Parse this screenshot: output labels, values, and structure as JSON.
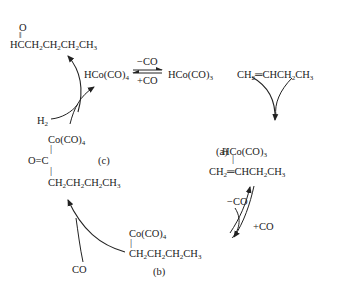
{
  "diagram": {
    "type": "catalytic cycle",
    "species": {
      "product_aldehyde": {
        "carbonyl_o": "O",
        "formula": "HCCH2CH2CH2CH3"
      },
      "catalyst_precursor": "HCo(CO)4",
      "active_catalyst": "HCo(CO)3",
      "alkene": "CH2=CHCH2CH3",
      "complex_a": {
        "label": "(a)",
        "top": "HCo(CO)3",
        "bottom": "CH2=CHCH2CH3"
      },
      "complex_b": {
        "label": "(b)",
        "top": "Co(CO)4",
        "bottom": "CH2CH2CH2CH3"
      },
      "complex_c": {
        "label": "(c)",
        "top": "Co(CO)4",
        "middle": "O=C",
        "bottom": "CH2CH2CH2CH3"
      },
      "h2": "H2",
      "co_in": "CO"
    },
    "equilibria": {
      "top": {
        "forward": "−CO",
        "reverse": "+CO"
      },
      "right": {
        "forward": "−CO",
        "reverse": "+CO"
      }
    }
  }
}
